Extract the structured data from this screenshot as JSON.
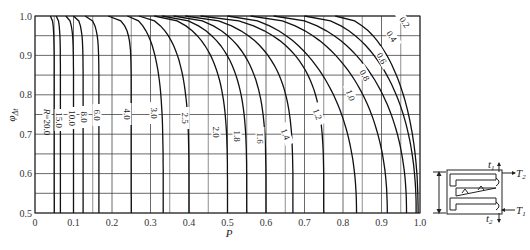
{
  "chart_data": {
    "type": "line",
    "title": "",
    "xlabel": "P",
    "ylabel": "φΔt",
    "xlim": [
      0,
      1.0
    ],
    "ylim": [
      0.5,
      1.0
    ],
    "grid": true,
    "x_ticks": [
      "0",
      "0.1",
      "0.2",
      "0.3",
      "0.4",
      "0.5",
      "0.6",
      "0.7",
      "0.8",
      "0.9",
      "1.0"
    ],
    "y_ticks": [
      "0.5",
      "0.6",
      "0.7",
      "0.8",
      "0.9",
      "1.0"
    ],
    "legend": "none (curves labeled inline by R value)",
    "series": [
      {
        "name": "R=20.0",
        "label": "R=20.0",
        "p_at_bottom": 0.05,
        "p_start_bend": 0.04
      },
      {
        "name": "15.0",
        "label": "15.0",
        "p_at_bottom": 0.066,
        "p_start_bend": 0.055
      },
      {
        "name": "10.0",
        "label": "10.0",
        "p_at_bottom": 0.1,
        "p_start_bend": 0.08
      },
      {
        "name": "8.0",
        "label": "8.0",
        "p_at_bottom": 0.125,
        "p_start_bend": 0.1
      },
      {
        "name": "6.0",
        "label": "6.0",
        "p_at_bottom": 0.166,
        "p_start_bend": 0.13
      },
      {
        "name": "4.0",
        "label": "4.0",
        "p_at_bottom": 0.25,
        "p_start_bend": 0.19
      },
      {
        "name": "3.0",
        "label": "3.0",
        "p_at_bottom": 0.333,
        "p_start_bend": 0.24
      },
      {
        "name": "2.5",
        "label": "2.5",
        "p_at_bottom": 0.4,
        "p_start_bend": 0.27
      },
      {
        "name": "2.0",
        "label": "2.0",
        "p_at_bottom": 0.5,
        "p_start_bend": 0.31
      },
      {
        "name": "1.8",
        "label": "1.8",
        "p_at_bottom": 0.55,
        "p_start_bend": 0.33
      },
      {
        "name": "1.6",
        "label": "1.6",
        "p_at_bottom": 0.6,
        "p_start_bend": 0.36
      },
      {
        "name": "1.4",
        "label": "1.4",
        "p_at_bottom": 0.67,
        "p_start_bend": 0.39
      },
      {
        "name": "1.2",
        "label": "1.2",
        "p_at_bottom": 0.75,
        "p_start_bend": 0.43
      },
      {
        "name": "1.0",
        "label": "1.0",
        "p_at_bottom": 0.835,
        "p_start_bend": 0.5
      },
      {
        "name": "0.8",
        "label": "0.8",
        "p_at_bottom": 0.915,
        "p_start_bend": 0.56
      },
      {
        "name": "0.6",
        "label": "0.6",
        "p_at_bottom": 0.965,
        "p_start_bend": 0.62
      },
      {
        "name": "0.4",
        "label": "0.4",
        "p_at_bottom": 0.99,
        "p_start_bend": 0.7
      },
      {
        "name": "0.2",
        "label": "0.2",
        "p_at_bottom": 0.995,
        "p_start_bend": 0.78
      }
    ],
    "inset_diagram": {
      "labels": [
        "t1",
        "T2",
        "T1",
        "t2"
      ]
    }
  },
  "axis": {
    "x_label": "P",
    "y_label_main": "φ",
    "y_label_sub": "Δt"
  },
  "diagram": {
    "t1": "t",
    "t1_sub": "1",
    "T2": "T",
    "T2_sub": "2",
    "T1": "T",
    "T1_sub": "1",
    "t2": "t",
    "t2_sub": "2"
  }
}
